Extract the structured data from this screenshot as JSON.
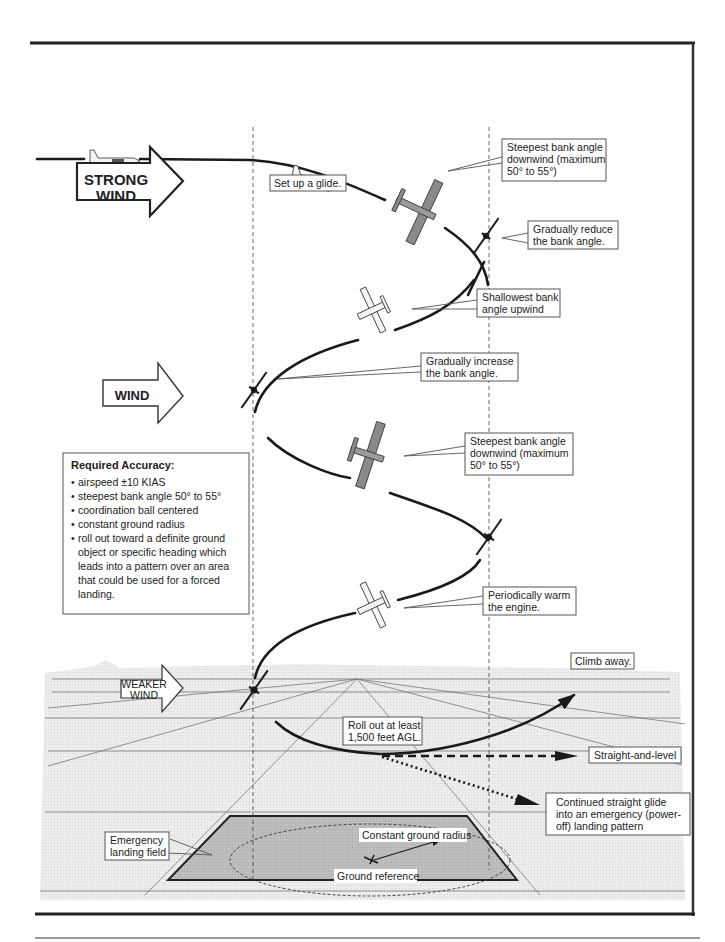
{
  "diagram": {
    "colors": {
      "frame": "#222222",
      "ground": "#e9e9e9",
      "field": "#b9b9b9",
      "plane_gray": "#8a8a8a",
      "flight_path": "#1a1a1a"
    },
    "wind_arrows": [
      {
        "label_line1": "STRONG",
        "label_line2": "WIND"
      },
      {
        "label_line1": "WIND"
      },
      {
        "label_line1": "WEAKER",
        "label_line2": "WIND"
      }
    ],
    "callouts": {
      "setup": "Set up  a glide.",
      "steepest1": {
        "l1": "Steepest bank angle",
        "l2": "downwind (maximum",
        "l3": "50° to 55°)"
      },
      "reduce": {
        "l1": "Gradually reduce",
        "l2": "the bank angle."
      },
      "shallowest": {
        "l1": "Shallowest bank",
        "l2": "angle upwind"
      },
      "increase": {
        "l1": "Gradually increase",
        "l2": "the bank angle."
      },
      "steepest2": {
        "l1": "Steepest bank angle",
        "l2": "downwind (maximum",
        "l3": "50° to 55°)"
      },
      "warm": {
        "l1": "Periodically warm",
        "l2": "the engine."
      },
      "climb": "Climb away.",
      "rollout": {
        "l1": "Roll out at least",
        "l2": "1,500 feet AGL."
      },
      "straight": "Straight-and-level",
      "glide": {
        "l1": "Continued straight glide",
        "l2": "into an emergency (power-",
        "l3": "off) landing pattern"
      },
      "field": {
        "l1": "Emergency",
        "l2": "landing field"
      },
      "radius": "Constant ground radius",
      "reference": "Ground reference"
    },
    "accuracy": {
      "title": "Required Accuracy:",
      "items": [
        "airspeed ±10 KIAS",
        "steepest bank angle 50° to 55°",
        "coordination ball centered",
        "constant ground radius",
        "roll out toward a definite ground",
        "object or specific heading which",
        "leads into a pattern over an area",
        "that could be used for a forced",
        "landing."
      ]
    }
  }
}
